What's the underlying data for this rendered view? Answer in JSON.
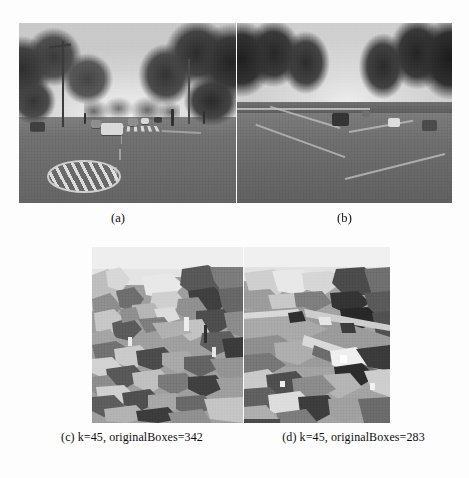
{
  "figure": {
    "kind": "four-panel-grayscale-figure",
    "background_color": "#fdfdfd",
    "panels": [
      {
        "id": "a",
        "caption": "(a)",
        "description": "grayscale photo of an urban road with trees on both sides, parked and moving cars, a crosswalk and a painted road roundel in the foreground"
      },
      {
        "id": "b",
        "caption": "(b)",
        "description": "grayscale photo of a highway lined with dense dark rows of trees, a central median and several distant vehicles"
      },
      {
        "id": "c",
        "caption": "(c) k=45, originalBoxes=342",
        "description": "graph-based segmentation result of the urban road scene, rendered as flat grey regions",
        "k": 45,
        "originalBoxes": 342
      },
      {
        "id": "d",
        "caption": "(d) k=45, originalBoxes=283",
        "description": "graph-based segmentation result of the highway scene, rendered as flat grey regions",
        "k": 45,
        "originalBoxes": 283
      }
    ]
  },
  "captions": {
    "a": "(a)",
    "b": "(b)",
    "c": "(c) k=45, originalBoxes=342",
    "d": "(d) k=45, originalBoxes=283"
  },
  "parameters": {
    "k_label": "k",
    "k_value": 45,
    "boxes_label": "originalBoxes",
    "boxes_c": 342,
    "boxes_d": 283
  },
  "palette": {
    "page_background": "#fdfdfd",
    "text_color": "#0d0d0d",
    "road_gray": "#6a6a6a",
    "sky_gray": "#dcdcdc",
    "foliage_dark": "#2a2a2a",
    "segment_light": "#d5d5d5",
    "segment_mid": "#9a9a9a",
    "segment_dark": "#4a4a4a"
  }
}
